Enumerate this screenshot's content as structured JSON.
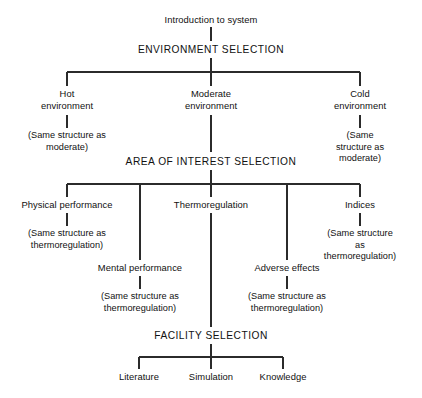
{
  "diagram": {
    "type": "tree-flowchart",
    "background_color": "#ffffff",
    "line_color": "#2b2b2b",
    "text_color": "#111111",
    "levels": [
      {
        "name": "entry",
        "nodes": [
          "Introduction to system"
        ]
      },
      {
        "name": "environment-selection",
        "heading": "ENVIRONMENT SELECTION",
        "nodes": [
          "Hot environment",
          "Moderate environment",
          "Cold environment"
        ]
      },
      {
        "name": "area-of-interest-selection",
        "heading": "AREA OF INTEREST SELECTION",
        "nodes": [
          "Physical performance",
          "Thermoregulation",
          "Indices",
          "Mental performance",
          "Adverse effects"
        ]
      },
      {
        "name": "facility-selection",
        "heading": "FACILITY SELECTION",
        "nodes": [
          "Literature",
          "Simulation",
          "Knowledge"
        ]
      }
    ],
    "nodes": {
      "intro": "Introduction to system",
      "environment_selection": "ENVIRONMENT SELECTION",
      "hot_environment": "Hot\nenvironment",
      "moderate_environment": "Moderate\nenvironment",
      "cold_environment": "Cold\nenvironment",
      "hot_note": "(Same structure as\nmoderate)",
      "cold_note": "(Same structure as\nmoderate)",
      "area_of_interest_selection": "AREA OF INTEREST SELECTION",
      "physical_performance": "Physical performance",
      "physical_performance_note": "(Same structure as\nthermoregulation)",
      "thermoregulation": "Thermoregulation",
      "indices": "Indices",
      "indices_note": "(Same structure as\nthermoregulation)",
      "mental_performance": "Mental performance",
      "mental_performance_note": "(Same structure as\nthermoregulation)",
      "adverse_effects": "Adverse effects",
      "adverse_effects_note": "(Same structure as\nthermoregulation)",
      "facility_selection": "FACILITY SELECTION",
      "literature": "Literature",
      "simulation": "Simulation",
      "knowledge": "Knowledge"
    }
  }
}
